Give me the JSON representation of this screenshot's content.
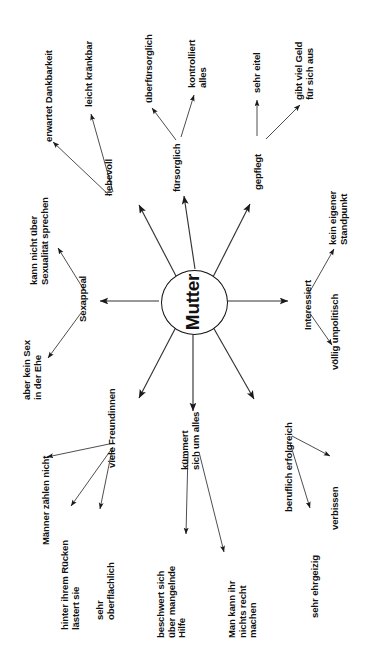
{
  "diagram": {
    "title": "Mutter",
    "type": "mind-map",
    "language": "de",
    "orientation": "rotated-90",
    "center": {
      "label": "Mutter",
      "shape": "ellipse"
    },
    "branches": [
      {
        "id": "liebevoll",
        "label": "liebevoll",
        "children": [
          {
            "id": "erwartet-dankbarkeit",
            "label": "erwartet Dankbarkeit"
          },
          {
            "id": "leicht-kraenkbar",
            "label": "leicht kränkbar"
          }
        ]
      },
      {
        "id": "fuersorglich",
        "label": "fürsorglich",
        "children": [
          {
            "id": "ueberfuersorglich",
            "label": "überfürsorglich"
          },
          {
            "id": "kontrolliert-alles",
            "label": "kontrolliert\nalles"
          }
        ]
      },
      {
        "id": "gepflegt",
        "label": "gepflegt",
        "children": [
          {
            "id": "sehr-eitel",
            "label": "sehr eitel"
          },
          {
            "id": "gibt-viel-geld",
            "label": "gibt viel Geld\nfür sich aus"
          }
        ]
      },
      {
        "id": "interessiert",
        "label": "Interessiert",
        "children": [
          {
            "id": "kein-eigener-standpunkt",
            "label": "kein eigener\nStandpunkt"
          },
          {
            "id": "voellig-unpolitisch",
            "label": "völlig unpolitisch"
          }
        ]
      },
      {
        "id": "sexappeal",
        "label": "Sexappeal",
        "children": [
          {
            "id": "kann-nicht-ueber-sexualitaet",
            "label": "kann nicht über\nSexualität sprechen"
          },
          {
            "id": "aber-kein-sex",
            "label": "aber kein Sex\nin der Ehe"
          }
        ]
      },
      {
        "id": "viele-freundinnen",
        "label": "viele Freundinnen",
        "children": [
          {
            "id": "maenner-zaehlen-nicht",
            "label": "Männer zählen nicht"
          },
          {
            "id": "hinter-ihrem-ruecken",
            "label": "hinter ihrem Rücken\nlästert sie"
          },
          {
            "id": "sehr-oberflaechlich",
            "label": "sehr\noberflächlich"
          }
        ]
      },
      {
        "id": "kuemmert-sich-um-alles",
        "label": "kümmert\nsich um alles",
        "children": [
          {
            "id": "beschwert-sich",
            "label": "beschwert sich\nüber mangelnde\nHilfe"
          },
          {
            "id": "nichts-recht-machen",
            "label": "Man kann ihr\nnichts recht\nmachen"
          }
        ]
      },
      {
        "id": "beruflich-erfolgreich",
        "label": "beruflich erfolgreich",
        "children": [
          {
            "id": "verbissen",
            "label": "verbissen"
          },
          {
            "id": "sehr-ehrgeizig",
            "label": "sehr ehrgeizig"
          }
        ]
      }
    ],
    "colors": {
      "background": "#ffffff",
      "stroke": "#222222",
      "text": "#111111"
    }
  }
}
